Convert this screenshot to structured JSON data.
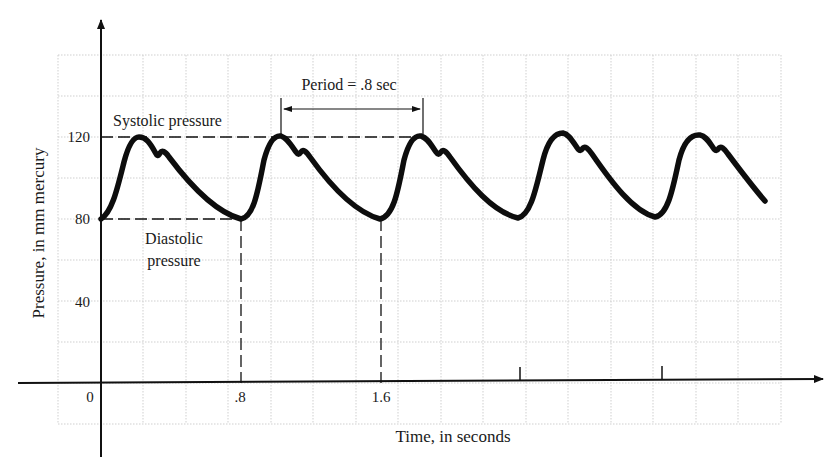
{
  "chart_data": {
    "type": "line",
    "title": "",
    "xlabel": "Time, in seconds",
    "ylabel": "Pressure, in mm mercury",
    "x_ticks": [
      "0",
      ".8",
      "1.6"
    ],
    "y_ticks": [
      "40",
      "80",
      "120"
    ],
    "xlim": [
      0,
      3.8
    ],
    "ylim": [
      -20,
      160
    ],
    "grid": true,
    "annotations": {
      "systolic": "Systolic pressure",
      "diastolic_line1": "Diastolic",
      "diastolic_line2": "pressure",
      "period": "Period = .8 sec"
    },
    "series": [
      {
        "name": "Blood pressure",
        "x": [
          0.0,
          0.11,
          0.22,
          0.31,
          0.36,
          0.8,
          0.91,
          1.02,
          1.11,
          1.16,
          1.6,
          1.71,
          1.82,
          1.91,
          1.96,
          2.4,
          2.51,
          2.62,
          2.71,
          2.76,
          3.2,
          3.31,
          3.42,
          3.51,
          3.56,
          3.82
        ],
        "y": [
          80,
          120,
          112,
          113,
          110,
          80,
          120,
          112,
          113,
          110,
          80,
          120,
          112,
          113,
          110,
          80,
          121,
          113,
          114,
          111,
          81,
          120,
          112,
          113,
          110,
          88
        ]
      }
    ],
    "reference_values": {
      "systolic_mmHg": 120,
      "diastolic_mmHg": 80,
      "period_sec": 0.8
    }
  }
}
